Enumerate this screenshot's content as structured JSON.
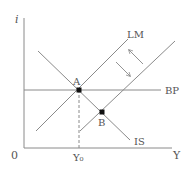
{
  "diagram": {
    "axes": {
      "y_label": "i",
      "x_label": "Y",
      "origin_label": "0",
      "x_tick_label": "Y₀"
    },
    "curves": {
      "lm": {
        "label": "LM"
      },
      "is": {
        "label": "IS"
      },
      "bp": {
        "label": "BP"
      }
    },
    "points": {
      "a": {
        "label": "A"
      },
      "b": {
        "label": "B"
      }
    },
    "colors": {
      "line": "#8a8a8a",
      "point": "#111111",
      "text": "#555555"
    }
  }
}
